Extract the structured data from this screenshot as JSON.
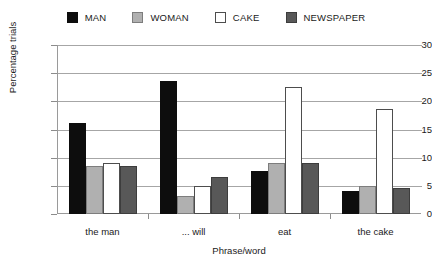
{
  "chart_data": {
    "type": "bar",
    "title": "",
    "subtitle": "",
    "xlabel": "Phrase/word",
    "ylabel": "Percentage trials",
    "categories": [
      "the man",
      "... will",
      "eat",
      "the cake"
    ],
    "series": [
      {
        "name": "MAN",
        "color": "#0d0d0d",
        "values": [
          16.1,
          23.7,
          7.6,
          4.0
        ]
      },
      {
        "name": "WOMAN",
        "color": "#b0b0b0",
        "values": [
          8.6,
          3.2,
          9.0,
          5.0
        ]
      },
      {
        "name": "CAKE",
        "color": "#ffffff",
        "values": [
          9.0,
          5.0,
          22.6,
          18.7
        ]
      },
      {
        "name": "NEWSPAPER",
        "color": "#585858",
        "values": [
          8.5,
          6.5,
          9.0,
          4.6
        ]
      }
    ],
    "ylim": [
      0,
      30
    ],
    "yticks": [
      0,
      5,
      10,
      15,
      20,
      25,
      30
    ],
    "ytick_labels": [
      "0",
      "5",
      "10",
      "15",
      "20",
      "25",
      "30"
    ],
    "grid": true,
    "legend_position": "top",
    "legend_entries": [
      {
        "label": "MAN",
        "swatch": "#0d0d0d"
      },
      {
        "label": "WOMAN",
        "swatch": "#b0b0b0"
      },
      {
        "label": "CAKE",
        "swatch": "#ffffff"
      },
      {
        "label": "NEWSPAPER",
        "swatch": "#585858"
      }
    ]
  }
}
